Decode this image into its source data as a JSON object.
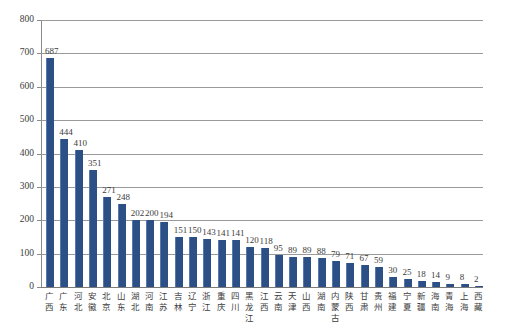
{
  "chart_data": {
    "type": "bar",
    "title": "",
    "subtitle": "",
    "xlabel": "",
    "ylabel": "",
    "ylim": [
      0,
      800
    ],
    "y_ticks": [
      0,
      100,
      200,
      300,
      400,
      500,
      600,
      700,
      800
    ],
    "grid": true,
    "legend": "none",
    "series_color": "#2c4f86",
    "categories": [
      "广西",
      "广东",
      "河北",
      "安徽",
      "北京",
      "山东",
      "湖北",
      "河南",
      "江苏",
      "吉林",
      "辽宁",
      "浙江",
      "重庆",
      "四川",
      "黑龙江",
      "江西",
      "云南",
      "天津",
      "山西",
      "湖南",
      "内蒙古",
      "陕西",
      "甘肃",
      "贵州",
      "福建",
      "宁夏",
      "新疆",
      "海南",
      "青海",
      "上海",
      "西藏"
    ],
    "values": [
      687,
      444,
      410,
      351,
      271,
      248,
      202,
      200,
      194,
      151,
      150,
      143,
      141,
      141,
      120,
      118,
      95,
      89,
      89,
      88,
      79,
      71,
      67,
      59,
      30,
      25,
      18,
      14,
      9,
      8,
      2
    ]
  }
}
